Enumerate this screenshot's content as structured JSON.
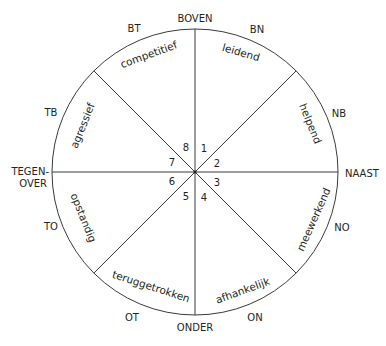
{
  "diagram": {
    "title": "",
    "center": {
      "x": 195,
      "y": 172
    },
    "radius": 143,
    "line_color": "#3a3a3a",
    "text_color": "#231f20",
    "directions": {
      "top": "BOVEN",
      "bottom": "ONDER",
      "left_line1": "TEGEN-",
      "left_line2": "OVER",
      "right": "NAAST",
      "top_left": "BT",
      "top_right": "BN",
      "right_top": "NB",
      "right_bottom": "NO",
      "bottom_right": "ON",
      "bottom_left": "OT",
      "left_bottom": "TO",
      "left_top": "TB"
    },
    "segments": [
      {
        "number": "1",
        "label": "leidend"
      },
      {
        "number": "2",
        "label": "helpend"
      },
      {
        "number": "3",
        "label": "meewerkend"
      },
      {
        "number": "4",
        "label": "afhankelijk"
      },
      {
        "number": "5",
        "label": "teruggetrokken"
      },
      {
        "number": "6",
        "label": "opstandig"
      },
      {
        "number": "7",
        "label": "agressief"
      },
      {
        "number": "8",
        "label": "competitief"
      }
    ]
  }
}
